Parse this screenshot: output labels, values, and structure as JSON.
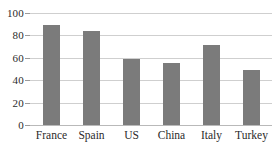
{
  "chart_data": {
    "type": "bar",
    "title": "",
    "subtitle": "",
    "xlabel": "",
    "ylabel": "",
    "categories": [
      "France",
      "Spain",
      "US",
      "China",
      "Italy",
      "Turkey"
    ],
    "values": [
      89,
      84,
      59,
      55,
      71,
      49
    ],
    "series": [
      {
        "name": "",
        "values": [
          89,
          84,
          59,
          55,
          71,
          49
        ]
      }
    ],
    "ylim": [
      0,
      100
    ],
    "y_ticks": [
      0,
      20,
      40,
      60,
      80,
      100
    ],
    "y_tick_labels": [
      "0",
      "20",
      "40",
      "60",
      "80",
      "100"
    ],
    "x_tick_labels": [
      "France",
      "Spain",
      "US",
      "China",
      "Italy",
      "Turkey"
    ],
    "grid": true,
    "grid_axis": "y",
    "legend": false,
    "legend_position": "none",
    "annotations": [],
    "bar_color": "#7b7b7b",
    "gridline_color": "#cfcfcf",
    "axis_color": "#b9b9b9",
    "background_color": "#ffffff"
  }
}
